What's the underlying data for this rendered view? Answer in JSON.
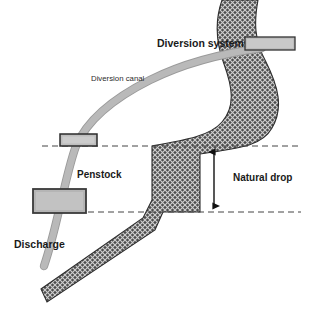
{
  "diagram": {
    "background_color": "#ffffff",
    "labels": {
      "diversion_system": "Diversion system",
      "diversion_canal": "Diversion canal",
      "penstock": "Penstock",
      "discharge": "Discharge",
      "natural_drop": "Natural drop"
    },
    "colors": {
      "river_fill_dark": "#4a4a4a",
      "river_fill_light": "#c8c8c8",
      "river_outline": "#2d2d2d",
      "canal_pipe": "#b3b3b3",
      "canal_pipe_edge": "#9a9a9a",
      "box_fill": "#b8b8b8",
      "box_border": "#333333",
      "dashed_line": "#444444",
      "arrow": "#111111",
      "text": "#1a1a1a"
    },
    "elements": {
      "river": {
        "name": "river-channel",
        "pattern": "cross-hatch-diamond"
      },
      "canal": {
        "name": "diversion-canal-pipe",
        "width_px": 7
      },
      "diversion_box": {
        "x": 245,
        "y": 37,
        "w": 50,
        "h": 13
      },
      "intake_box": {
        "x": 60,
        "y": 134,
        "w": 37,
        "h": 12
      },
      "powerhouse_box": {
        "x": 33,
        "y": 189,
        "w": 53,
        "h": 24
      },
      "upper_level_line": {
        "y": 146,
        "x1": 42,
        "x2": 301
      },
      "lower_level_line": {
        "y": 212,
        "x1": 78,
        "x2": 301
      },
      "drop_arrow": {
        "x": 214,
        "y1": 148,
        "y2": 210
      }
    },
    "label_positions": {
      "diversion_system": {
        "x": 157,
        "y": 47,
        "size": 10.5
      },
      "diversion_canal": {
        "x": 91,
        "y": 81,
        "size": 7.8
      },
      "penstock": {
        "x": 77,
        "y": 178,
        "size": 10
      },
      "discharge": {
        "x": 14,
        "y": 248,
        "size": 10.5
      },
      "natural_drop": {
        "x": 233,
        "y": 181,
        "size": 10
      }
    }
  }
}
